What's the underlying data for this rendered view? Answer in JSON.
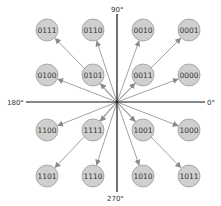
{
  "diagram": {
    "colors": {
      "node_fill": "#cfcfcf",
      "node_stroke": "#9a9a9a",
      "arrow": "#8a8a8a",
      "axis": "#111111",
      "text": "#333333"
    },
    "origin": {
      "x": 117,
      "y": 102
    },
    "axes": {
      "label_0": "0°",
      "label_90": "90°",
      "label_180": "180°",
      "label_270": "270°"
    },
    "nodes": [
      {
        "label": "0111",
        "x": 47,
        "y": 30
      },
      {
        "label": "0110",
        "x": 93,
        "y": 30
      },
      {
        "label": "0010",
        "x": 143,
        "y": 30
      },
      {
        "label": "0001",
        "x": 189,
        "y": 30
      },
      {
        "label": "0100",
        "x": 47,
        "y": 75
      },
      {
        "label": "0101",
        "x": 93,
        "y": 75
      },
      {
        "label": "0011",
        "x": 143,
        "y": 75
      },
      {
        "label": "0000",
        "x": 189,
        "y": 75
      },
      {
        "label": "1100",
        "x": 47,
        "y": 130
      },
      {
        "label": "1111",
        "x": 93,
        "y": 130
      },
      {
        "label": "1001",
        "x": 143,
        "y": 130
      },
      {
        "label": "1000",
        "x": 189,
        "y": 130
      },
      {
        "label": "1101",
        "x": 47,
        "y": 176
      },
      {
        "label": "1110",
        "x": 93,
        "y": 176
      },
      {
        "label": "1010",
        "x": 143,
        "y": 176
      },
      {
        "label": "1011",
        "x": 189,
        "y": 176
      }
    ],
    "node_radius": 11
  }
}
